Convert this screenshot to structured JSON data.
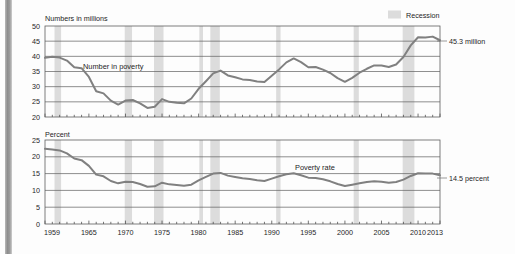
{
  "legend": {
    "recession_label": "Recession",
    "recession_color": "#dcdcdc"
  },
  "annotations": {
    "top_callout": "45.3 million",
    "bottom_callout": "14.5 percent",
    "top_series_label": "Number in poverty",
    "bottom_series_label": "Poverty rate"
  },
  "chart_data": [
    {
      "type": "line",
      "title": "",
      "ylabel": "Numbers in millions",
      "xlabel": "",
      "ylim": [
        20,
        50
      ],
      "yticks": [
        20,
        25,
        30,
        35,
        40,
        45,
        50
      ],
      "xlim": [
        1959,
        2013
      ],
      "xticks": [
        1959,
        1965,
        1970,
        1975,
        1980,
        1985,
        1990,
        1995,
        2000,
        2005,
        2010,
        2013
      ],
      "grid": true,
      "legend_position": "top-right",
      "series": [
        {
          "name": "Number in poverty",
          "x": [
            1959,
            1960,
            1961,
            1962,
            1963,
            1964,
            1965,
            1966,
            1967,
            1968,
            1969,
            1970,
            1971,
            1972,
            1973,
            1974,
            1975,
            1976,
            1977,
            1978,
            1979,
            1980,
            1981,
            1982,
            1983,
            1984,
            1985,
            1986,
            1987,
            1988,
            1989,
            1990,
            1991,
            1992,
            1993,
            1994,
            1995,
            1996,
            1997,
            1998,
            1999,
            2000,
            2001,
            2002,
            2003,
            2004,
            2005,
            2006,
            2007,
            2008,
            2009,
            2010,
            2011,
            2012,
            2013
          ],
          "values": [
            39.5,
            39.9,
            39.6,
            38.6,
            36.4,
            36.1,
            33.2,
            28.5,
            27.8,
            25.4,
            24.1,
            25.4,
            25.6,
            24.5,
            23.0,
            23.4,
            25.9,
            25.0,
            24.7,
            24.5,
            26.1,
            29.3,
            31.8,
            34.4,
            35.3,
            33.7,
            33.1,
            32.4,
            32.2,
            31.7,
            31.5,
            33.6,
            35.7,
            38.0,
            39.3,
            38.1,
            36.4,
            36.5,
            35.6,
            34.5,
            32.8,
            31.6,
            32.9,
            34.6,
            35.9,
            37.0,
            37.0,
            36.5,
            37.3,
            39.8,
            43.6,
            46.3,
            46.2,
            46.5,
            45.3
          ]
        }
      ],
      "recessions": [
        {
          "start": 1960.3,
          "end": 1961.2
        },
        {
          "start": 1969.9,
          "end": 1970.9
        },
        {
          "start": 1973.9,
          "end": 1975.2
        },
        {
          "start": 1980.1,
          "end": 1980.6
        },
        {
          "start": 1981.6,
          "end": 1982.9
        },
        {
          "start": 1990.6,
          "end": 1991.2
        },
        {
          "start": 2001.2,
          "end": 2001.9
        },
        {
          "start": 2007.9,
          "end": 2009.5
        }
      ],
      "end_value_label": "45.3 million"
    },
    {
      "type": "line",
      "title": "",
      "ylabel": "Percent",
      "xlabel": "",
      "ylim": [
        0,
        25
      ],
      "yticks": [
        0,
        5,
        10,
        15,
        20,
        25
      ],
      "xlim": [
        1959,
        2013
      ],
      "xticks": [
        1959,
        1965,
        1970,
        1975,
        1980,
        1985,
        1990,
        1995,
        2000,
        2005,
        2010,
        2013
      ],
      "grid": true,
      "series": [
        {
          "name": "Poverty rate",
          "x": [
            1959,
            1960,
            1961,
            1962,
            1963,
            1964,
            1965,
            1966,
            1967,
            1968,
            1969,
            1970,
            1971,
            1972,
            1973,
            1974,
            1975,
            1976,
            1977,
            1978,
            1979,
            1980,
            1981,
            1982,
            1983,
            1984,
            1985,
            1986,
            1987,
            1988,
            1989,
            1990,
            1991,
            1992,
            1993,
            1994,
            1995,
            1996,
            1997,
            1998,
            1999,
            2000,
            2001,
            2002,
            2003,
            2004,
            2005,
            2006,
            2007,
            2008,
            2009,
            2010,
            2011,
            2012,
            2013
          ],
          "values": [
            22.4,
            22.2,
            21.9,
            21.0,
            19.5,
            19.0,
            17.3,
            14.7,
            14.2,
            12.8,
            12.1,
            12.6,
            12.5,
            11.9,
            11.1,
            11.2,
            12.3,
            11.8,
            11.6,
            11.4,
            11.7,
            13.0,
            14.0,
            15.0,
            15.2,
            14.4,
            14.0,
            13.6,
            13.4,
            13.0,
            12.8,
            13.5,
            14.2,
            14.8,
            15.1,
            14.5,
            13.8,
            13.7,
            13.3,
            12.7,
            11.9,
            11.3,
            11.7,
            12.1,
            12.5,
            12.7,
            12.6,
            12.3,
            12.5,
            13.2,
            14.3,
            15.1,
            15.0,
            15.0,
            14.5
          ]
        }
      ],
      "recessions": [
        {
          "start": 1960.3,
          "end": 1961.2
        },
        {
          "start": 1969.9,
          "end": 1970.9
        },
        {
          "start": 1973.9,
          "end": 1975.2
        },
        {
          "start": 1980.1,
          "end": 1980.6
        },
        {
          "start": 1981.6,
          "end": 1982.9
        },
        {
          "start": 1990.6,
          "end": 1991.2
        },
        {
          "start": 2001.2,
          "end": 2001.9
        },
        {
          "start": 2007.9,
          "end": 2009.5
        }
      ],
      "end_value_label": "14.5 percent"
    }
  ]
}
